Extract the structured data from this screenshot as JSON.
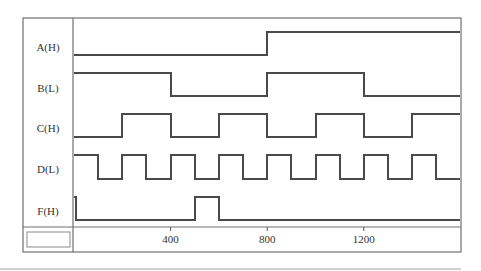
{
  "diagram": {
    "time_axis": {
      "ticks": [
        {
          "value": 400,
          "label": "400"
        },
        {
          "value": 800,
          "label": "800"
        },
        {
          "value": 1200,
          "label": "1200"
        }
      ],
      "range": [
        0,
        1600
      ]
    },
    "signals": [
      {
        "name": "A(H)",
        "initial": 0,
        "transitions": [
          800
        ]
      },
      {
        "name": "B(L)",
        "initial": 1,
        "transitions": [
          400,
          800,
          1200
        ]
      },
      {
        "name": "C(H)",
        "initial": 0,
        "transitions": [
          200,
          400,
          600,
          800,
          1000,
          1200,
          1400
        ]
      },
      {
        "name": "D(L)",
        "initial": 1,
        "transitions": [
          100,
          200,
          300,
          400,
          500,
          600,
          700,
          800,
          900,
          1000,
          1100,
          1200,
          1300,
          1400,
          1500
        ]
      },
      {
        "name": "F(H)",
        "initial": 1,
        "transitions": [
          10,
          500,
          600
        ]
      }
    ],
    "corner_box_value": ""
  },
  "colors": {
    "wave": "#4a4a4a",
    "frame": "#707070",
    "background": "#ffffff"
  }
}
